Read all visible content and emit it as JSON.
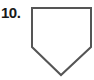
{
  "problem": {
    "number_label": "10."
  },
  "figure": {
    "shape": "pentagon",
    "stroke_color": "#555555",
    "fill_color": "#ffffff",
    "points": [
      [
        32,
        8
      ],
      [
        91,
        8
      ],
      [
        91,
        47
      ],
      [
        61,
        75
      ],
      [
        32,
        47
      ]
    ]
  }
}
